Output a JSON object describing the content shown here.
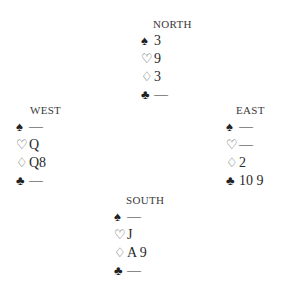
{
  "hands": {
    "north": {
      "label": "NORTH",
      "spades": "3",
      "hearts": "9",
      "diamonds": "3",
      "clubs": "—"
    },
    "west": {
      "label": "WEST",
      "spades": "—",
      "hearts": "Q",
      "diamonds": "Q8",
      "clubs": "—"
    },
    "east": {
      "label": "EAST",
      "spades": "—",
      "hearts": "—",
      "diamonds": "2",
      "clubs": "10 9"
    },
    "south": {
      "label": "SOUTH",
      "spades": "—",
      "hearts": "J",
      "diamonds": "A 9",
      "clubs": "—"
    }
  },
  "suits": {
    "spades": "♠",
    "hearts": "♡",
    "diamonds": "♢",
    "clubs": "♣"
  }
}
